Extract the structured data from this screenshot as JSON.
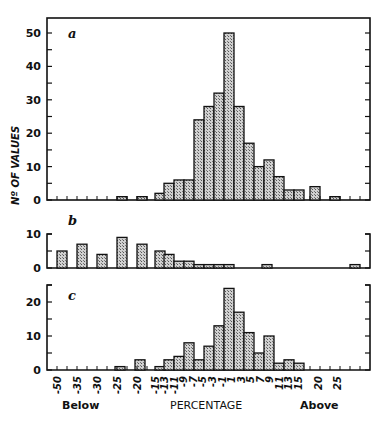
{
  "figure": {
    "ylabel": "Nº OF VALUES",
    "xlabel": "PERCENTAGE",
    "below_label": "Below",
    "above_label": "Above",
    "x_tick_labels": [
      "-50",
      "-35",
      "-30",
      "-25",
      "-20",
      "-15",
      "-13",
      "-11",
      "-9",
      "-7",
      "-5",
      "-3",
      "-1",
      "1",
      "3",
      "5",
      "7",
      "9",
      "11",
      "13",
      "15",
      "20",
      "25"
    ]
  },
  "colors": {
    "bar_fill": "#b8b8b8",
    "ink": "#111111",
    "background": "#ffffff"
  },
  "chart_data": [
    {
      "type": "bar",
      "panel": "a",
      "title": "a",
      "xlabel": "PERCENTAGE",
      "ylabel": "Nº OF VALUES",
      "ylim": [
        0,
        55
      ],
      "yticks": [
        0,
        10,
        20,
        30,
        40,
        50
      ],
      "categories": [
        "-25",
        "-20",
        "-15",
        "-13",
        "-11",
        "-9",
        "-7",
        "-5",
        "-3",
        "-1",
        "1",
        "3",
        "5",
        "7",
        "9",
        "11",
        "13",
        "15",
        "20",
        "25"
      ],
      "values": [
        1,
        1,
        2,
        5,
        6,
        6,
        24,
        28,
        32,
        50,
        28,
        17,
        10,
        12,
        7,
        3,
        3,
        4,
        1,
        0
      ],
      "bar_x_px": [
        117,
        137,
        155,
        164,
        174,
        184,
        194,
        204,
        214,
        224,
        234,
        244,
        254,
        264,
        274,
        284,
        294,
        310,
        330,
        0
      ]
    },
    {
      "type": "bar",
      "panel": "b",
      "title": "b",
      "ylim": [
        0,
        10
      ],
      "yticks": [
        0,
        10
      ],
      "categories": [
        "-50",
        "-35",
        "-30",
        "-25",
        "-20",
        "-15",
        "-13",
        "-11",
        "-9",
        "-7",
        "-5",
        "-3",
        "-1",
        "7",
        "25+"
      ],
      "values": [
        5,
        7,
        4,
        9,
        7,
        5,
        4,
        2,
        2,
        1,
        1,
        1,
        1,
        1,
        1
      ],
      "bar_x_px": [
        57,
        77,
        97,
        117,
        137,
        155,
        164,
        174,
        184,
        194,
        204,
        214,
        224,
        262,
        350
      ]
    },
    {
      "type": "bar",
      "panel": "c",
      "title": "c",
      "ylim": [
        0,
        25
      ],
      "yticks": [
        0,
        10,
        20
      ],
      "categories": [
        "-25",
        "-20",
        "-15",
        "-13",
        "-11",
        "-9",
        "-7",
        "-5",
        "-3",
        "-1",
        "1",
        "3",
        "5",
        "7",
        "9",
        "11",
        "13"
      ],
      "values": [
        1,
        3,
        1,
        3,
        4,
        8,
        3,
        7,
        13,
        24,
        17,
        11,
        5,
        10,
        2,
        3,
        2
      ],
      "bar_x_px": [
        115,
        135,
        155,
        164,
        174,
        184,
        194,
        204,
        214,
        224,
        234,
        244,
        254,
        264,
        274,
        284,
        294
      ]
    }
  ]
}
